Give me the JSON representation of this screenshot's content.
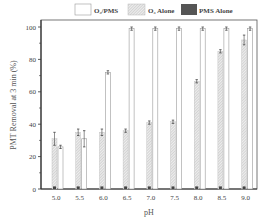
{
  "chart_data": {
    "type": "bar",
    "title": "",
    "xlabel": "pH",
    "ylabel": "PMT Removal at 3 min (%)",
    "ylim": [
      0,
      100
    ],
    "yticks": [
      0,
      20,
      40,
      60,
      80,
      100
    ],
    "categories": [
      "5.0",
      "5.5",
      "6.0",
      "6.5",
      "7.0",
      "7.5",
      "8.0",
      "8.5",
      "9.0"
    ],
    "legend_position": "top",
    "grid": false,
    "series": [
      {
        "name": "O3/PMS",
        "style": "white",
        "values": [
          26,
          31,
          72,
          99,
          99,
          99,
          99,
          99,
          99
        ],
        "errors": [
          1,
          5,
          1,
          1,
          1,
          1,
          1,
          1,
          1
        ]
      },
      {
        "name": "O3 Alone",
        "style": "hatched",
        "values": [
          31,
          35,
          35,
          36,
          41,
          41.5,
          66.5,
          85,
          92
        ],
        "errors": [
          4,
          2,
          2,
          1,
          1,
          1,
          1,
          1,
          3
        ]
      },
      {
        "name": "PMS Alone",
        "style": "dark",
        "values": [
          1,
          1,
          1,
          1,
          1,
          1,
          1,
          1,
          1
        ],
        "errors": [
          0,
          0,
          0,
          0,
          0,
          0,
          0,
          0,
          0
        ]
      }
    ]
  },
  "legend": {
    "items": [
      {
        "label": "O₃/PMS"
      },
      {
        "label": "O₃ Alone"
      },
      {
        "label": "PMS Alone"
      }
    ]
  },
  "axes": {
    "xlabel": "pH",
    "ylabel": "PMT Removal at 3 min (%)"
  }
}
